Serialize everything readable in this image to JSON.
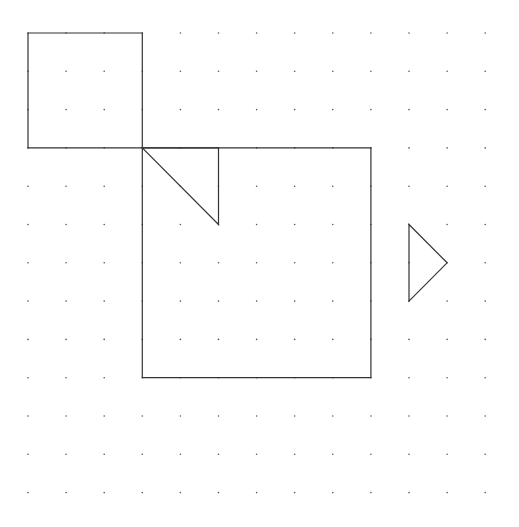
{
  "diagram": {
    "background": "#ffffff",
    "grid": {
      "cols": 13,
      "rows": 13,
      "origin_x": 28,
      "origin_y": 33,
      "spacing_x": 38.1,
      "spacing_y": 38.3,
      "dot_color": "#555555",
      "dot_radius": 0.8
    },
    "stroke_color": "#333333",
    "stroke_width": 1.2,
    "shapes": [
      {
        "name": "small-square",
        "type": "polygon",
        "points": [
          [
            0,
            0
          ],
          [
            3,
            0
          ],
          [
            3,
            3
          ],
          [
            0,
            3
          ]
        ]
      },
      {
        "name": "large-square",
        "type": "polygon",
        "points": [
          [
            3,
            3
          ],
          [
            9,
            3
          ],
          [
            9,
            9
          ],
          [
            3,
            9
          ]
        ]
      },
      {
        "name": "inner-triangle",
        "type": "polygon",
        "points": [
          [
            3,
            3
          ],
          [
            5,
            3
          ],
          [
            5,
            5
          ]
        ]
      },
      {
        "name": "right-triangle",
        "type": "polygon",
        "points": [
          [
            10,
            5
          ],
          [
            11,
            6
          ],
          [
            10,
            7
          ]
        ]
      }
    ]
  }
}
